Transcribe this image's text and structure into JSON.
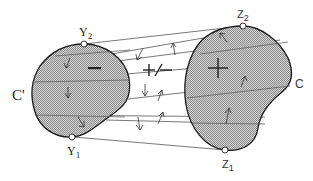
{
  "diagram": {
    "left_region": {
      "label": "C'",
      "sign": "−",
      "top_point": {
        "name": "Y",
        "sub": "2"
      },
      "bottom_point": {
        "name": "Y",
        "sub": "1"
      }
    },
    "right_region": {
      "label": "C",
      "sign": "+",
      "top_point": {
        "name": "Z",
        "sub": "2"
      },
      "bottom_point": {
        "name": "Z",
        "sub": "1"
      }
    },
    "middle_label": "+/−",
    "colors": {
      "fill": "#b8b8b8",
      "stroke": "#1a1a1a",
      "line": "#444444"
    }
  }
}
